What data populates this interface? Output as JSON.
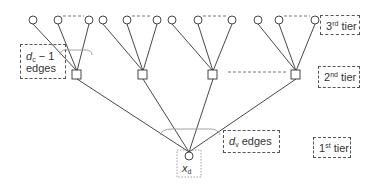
{
  "diagram": {
    "title": "",
    "tiers": {
      "third": {
        "num": "3",
        "sup": "rd",
        "word": "tier"
      },
      "second": {
        "num": "2",
        "sup": "nd",
        "word": "tier"
      },
      "first": {
        "num": "1",
        "sup": "st",
        "word": "tier"
      }
    },
    "labels": {
      "dc_edges_var": "d",
      "dc_edges_sub": "c",
      "dc_edges_rest": " − 1",
      "dc_edges_word": "edges",
      "dv_edges_var": "d",
      "dv_edges_sub": "v",
      "dv_edges_word": " edges",
      "root_var": "x",
      "root_sub": "d"
    },
    "nodes": {
      "root": {
        "type": "variable-node",
        "shape": "circle",
        "x": 189,
        "y": 156
      },
      "check_nodes": [
        {
          "shape": "square",
          "x": 77,
          "y": 75
        },
        {
          "shape": "square",
          "x": 143,
          "y": 75
        },
        {
          "shape": "square",
          "x": 213,
          "y": 75
        },
        {
          "shape": "square",
          "x": 296,
          "y": 75
        }
      ],
      "leaf_variable_nodes": [
        {
          "parent": 0,
          "x": 33,
          "y": 20
        },
        {
          "parent": 0,
          "x": 58,
          "y": 20
        },
        {
          "parent": 0,
          "x": 89,
          "y": 20
        },
        {
          "parent": 1,
          "x": 103,
          "y": 20
        },
        {
          "parent": 1,
          "x": 127,
          "y": 20
        },
        {
          "parent": 1,
          "x": 157,
          "y": 20
        },
        {
          "parent": 2,
          "x": 172,
          "y": 20
        },
        {
          "parent": 2,
          "x": 198,
          "y": 20
        },
        {
          "parent": 2,
          "x": 232,
          "y": 20
        },
        {
          "parent": 3,
          "x": 258,
          "y": 20
        },
        {
          "parent": 3,
          "x": 279,
          "y": 20
        },
        {
          "parent": 3,
          "x": 315,
          "y": 20
        }
      ]
    },
    "colors": {
      "line": "#333333",
      "dash": "#666666",
      "brace": "#999999"
    }
  }
}
